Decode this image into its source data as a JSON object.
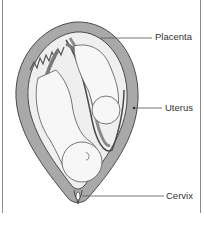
{
  "diagram": {
    "labels": {
      "placenta": "Placenta",
      "uterus": "Uterus",
      "cervix": "Cervix"
    },
    "colors": {
      "uterine_wall": "#a9a9a9",
      "outline": "#4a4a4a",
      "fetus_fill": "#f4f4f4",
      "leader_line": "#555555",
      "frame": "#8a8a8a"
    }
  }
}
